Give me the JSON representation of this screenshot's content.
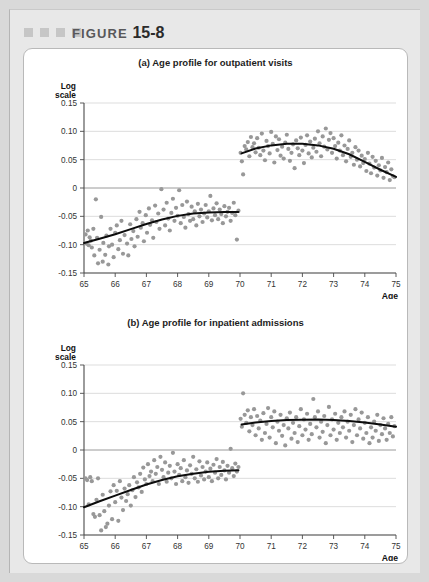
{
  "figure": {
    "label": "FIGURE",
    "number": "15-8",
    "marker_squares": 4,
    "square_color": "#c6c6c6",
    "panel_bg": "#e8e8e8",
    "card_bg": "#ffffff"
  },
  "style": {
    "dot_color": "#989898",
    "curve_color": "#0d0d0d",
    "grid_color": "#cfcfcf",
    "zero_line_color": "#8e8e8e",
    "axis_color": "#4a4a4a",
    "dot_radius": 2.1
  },
  "chart_data": [
    {
      "type": "scatter",
      "id": "panel-a",
      "title": "(a) Age profile for outpatient visits",
      "xlabel": "Age",
      "ylabel": "Log scale",
      "xlim": [
        65,
        75
      ],
      "ylim": [
        -0.15,
        0.15
      ],
      "xticks": [
        65,
        66,
        67,
        68,
        69,
        70,
        71,
        72,
        73,
        74,
        75
      ],
      "yticks": [
        0.15,
        0.1,
        0.05,
        0,
        -0.05,
        -0.1,
        -0.15
      ],
      "ytick_labels": [
        "0.15",
        "0.10",
        "0.05",
        "0",
        "-0.05",
        "-0.10",
        "-0.15"
      ],
      "grid": true,
      "discontinuity_at": 70,
      "legend": "none",
      "series": [
        {
          "name": "left-scatter",
          "x": [
            65.05,
            65.08,
            65.12,
            65.15,
            65.18,
            65.22,
            65.25,
            65.3,
            65.33,
            65.38,
            65.42,
            65.45,
            65.5,
            65.55,
            65.6,
            65.62,
            65.68,
            65.72,
            65.78,
            65.8,
            65.85,
            65.9,
            65.95,
            66.0,
            66.05,
            66.1,
            66.15,
            66.2,
            66.25,
            66.3,
            66.38,
            66.42,
            66.48,
            66.52,
            66.58,
            66.62,
            66.68,
            66.72,
            66.78,
            66.82,
            66.88,
            66.92,
            66.98,
            67.02,
            67.08,
            67.12,
            67.18,
            67.22,
            67.28,
            67.32,
            67.38,
            67.42,
            67.48,
            67.55,
            67.6,
            67.65,
            67.7,
            67.75,
            67.8,
            67.85,
            67.9,
            67.95,
            68.0,
            68.05,
            68.1,
            68.15,
            68.2,
            68.25,
            68.3,
            68.35,
            68.4,
            68.45,
            68.5,
            68.55,
            68.6,
            68.65,
            68.7,
            68.75,
            68.8,
            68.85,
            68.9,
            68.95,
            69.0,
            69.05,
            69.1,
            69.15,
            69.2,
            69.25,
            69.3,
            69.35,
            69.4,
            69.45,
            69.5,
            69.55,
            69.6,
            69.65,
            69.7,
            69.75,
            69.8,
            69.85,
            69.9,
            69.95
          ],
          "y": [
            -0.082,
            -0.098,
            -0.075,
            -0.101,
            -0.087,
            -0.093,
            -0.105,
            -0.072,
            -0.119,
            -0.02,
            -0.088,
            -0.133,
            -0.109,
            -0.051,
            -0.13,
            -0.097,
            -0.118,
            -0.084,
            -0.135,
            -0.103,
            -0.072,
            -0.1,
            -0.122,
            -0.079,
            -0.066,
            -0.108,
            -0.092,
            -0.058,
            -0.116,
            -0.083,
            -0.098,
            -0.119,
            -0.064,
            -0.09,
            -0.076,
            -0.103,
            -0.055,
            -0.086,
            -0.042,
            -0.07,
            -0.062,
            -0.094,
            -0.048,
            -0.079,
            -0.036,
            -0.065,
            -0.057,
            -0.088,
            -0.031,
            -0.06,
            -0.045,
            -0.072,
            -0.002,
            -0.038,
            -0.066,
            -0.026,
            -0.054,
            -0.075,
            -0.044,
            -0.019,
            -0.058,
            -0.035,
            -0.049,
            -0.004,
            -0.062,
            -0.03,
            -0.051,
            -0.07,
            -0.024,
            -0.046,
            -0.058,
            -0.033,
            -0.055,
            -0.041,
            -0.066,
            -0.028,
            -0.05,
            -0.038,
            -0.06,
            -0.045,
            -0.03,
            -0.052,
            -0.041,
            -0.014,
            -0.057,
            -0.036,
            -0.048,
            -0.027,
            -0.055,
            -0.038,
            -0.046,
            -0.062,
            -0.032,
            -0.05,
            -0.042,
            -0.035,
            -0.058,
            -0.044,
            -0.026,
            -0.048,
            -0.091,
            -0.04
          ]
        },
        {
          "name": "right-scatter",
          "x": [
            70.02,
            70.06,
            70.1,
            70.15,
            70.2,
            70.25,
            70.3,
            70.35,
            70.4,
            70.45,
            70.5,
            70.55,
            70.6,
            70.65,
            70.7,
            70.75,
            70.8,
            70.85,
            70.9,
            70.95,
            71.0,
            71.05,
            71.1,
            71.15,
            71.2,
            71.25,
            71.3,
            71.35,
            71.4,
            71.45,
            71.5,
            71.55,
            71.6,
            71.65,
            71.7,
            71.75,
            71.8,
            71.85,
            71.9,
            71.95,
            72.0,
            72.05,
            72.1,
            72.15,
            72.2,
            72.25,
            72.3,
            72.35,
            72.4,
            72.45,
            72.5,
            72.55,
            72.6,
            72.65,
            72.7,
            72.75,
            72.8,
            72.85,
            72.9,
            72.95,
            73.0,
            73.05,
            73.1,
            73.15,
            73.2,
            73.25,
            73.3,
            73.35,
            73.4,
            73.45,
            73.5,
            73.55,
            73.6,
            73.65,
            73.7,
            73.75,
            73.8,
            73.85,
            73.9,
            73.95,
            74.0,
            74.05,
            74.1,
            74.15,
            74.2,
            74.25,
            74.3,
            74.35,
            74.4,
            74.45,
            74.5,
            74.55,
            74.6,
            74.65,
            74.7,
            74.75,
            74.8,
            74.85,
            74.9,
            74.95
          ],
          "y": [
            0.062,
            0.047,
            0.024,
            0.074,
            0.068,
            0.081,
            0.056,
            0.09,
            0.072,
            0.079,
            0.063,
            0.088,
            0.071,
            0.058,
            0.096,
            0.066,
            0.049,
            0.083,
            0.074,
            0.061,
            0.099,
            0.078,
            0.045,
            0.091,
            0.067,
            0.086,
            0.057,
            0.073,
            0.052,
            0.08,
            0.094,
            0.069,
            0.048,
            0.062,
            0.077,
            0.035,
            0.084,
            0.07,
            0.058,
            0.089,
            0.066,
            0.044,
            0.076,
            0.093,
            0.061,
            0.082,
            0.054,
            0.071,
            0.087,
            0.064,
            0.1,
            0.079,
            0.056,
            0.091,
            0.073,
            0.105,
            0.068,
            0.085,
            0.097,
            0.062,
            0.088,
            0.074,
            0.052,
            0.08,
            0.066,
            0.093,
            0.058,
            0.075,
            0.047,
            0.069,
            0.084,
            0.055,
            0.062,
            0.041,
            0.072,
            0.05,
            0.066,
            0.038,
            0.057,
            0.044,
            0.051,
            0.03,
            0.062,
            0.043,
            0.026,
            0.055,
            0.036,
            0.048,
            0.022,
            0.04,
            0.031,
            0.053,
            0.018,
            0.037,
            0.028,
            0.045,
            0.014,
            0.033,
            0.021,
            0.019
          ]
        }
      ],
      "fit_curves": [
        {
          "name": "left-fit",
          "x": [
            65.0,
            65.5,
            66.0,
            66.5,
            67.0,
            67.5,
            68.0,
            68.5,
            69.0,
            69.5,
            69.95
          ],
          "y": [
            -0.097,
            -0.0895,
            -0.0815,
            -0.0725,
            -0.0635,
            -0.0555,
            -0.0492,
            -0.0452,
            -0.0432,
            -0.0425,
            -0.0424
          ]
        },
        {
          "name": "right-fit",
          "x": [
            70.05,
            70.5,
            71.0,
            71.5,
            72.0,
            72.5,
            73.0,
            73.5,
            74.0,
            74.5,
            75.0
          ],
          "y": [
            0.0612,
            0.0698,
            0.0752,
            0.0779,
            0.0779,
            0.0752,
            0.0692,
            0.0595,
            0.0462,
            0.0322,
            0.0195
          ]
        }
      ]
    },
    {
      "type": "scatter",
      "id": "panel-b",
      "title": "(b) Age profile for inpatient admissions",
      "xlabel": "Age",
      "ylabel": "Log scale",
      "xlim": [
        65,
        75
      ],
      "ylim": [
        -0.15,
        0.15
      ],
      "xticks": [
        65,
        66,
        67,
        68,
        69,
        70,
        71,
        72,
        73,
        74,
        75
      ],
      "yticks": [
        0.15,
        0.1,
        0.05,
        0,
        -0.05,
        -0.1,
        -0.15
      ],
      "ytick_labels": [
        "0.15",
        "0.10",
        "0.05",
        "0",
        "-0.05",
        "-0.10",
        "-0.15"
      ],
      "grid": true,
      "discontinuity_at": 70,
      "legend": "none",
      "series": [
        {
          "name": "left-scatter",
          "x": [
            65.05,
            65.1,
            65.15,
            65.2,
            65.25,
            65.3,
            65.35,
            65.4,
            65.45,
            65.5,
            65.55,
            65.6,
            65.65,
            65.7,
            65.75,
            65.8,
            65.85,
            65.9,
            65.95,
            66.0,
            66.05,
            66.1,
            66.15,
            66.2,
            66.25,
            66.3,
            66.35,
            66.4,
            66.45,
            66.5,
            66.55,
            66.6,
            66.65,
            66.7,
            66.75,
            66.8,
            66.85,
            66.9,
            66.95,
            67.0,
            67.05,
            67.1,
            67.15,
            67.2,
            67.25,
            67.3,
            67.35,
            67.4,
            67.45,
            67.5,
            67.55,
            67.6,
            67.65,
            67.7,
            67.75,
            67.8,
            67.85,
            67.9,
            67.95,
            68.0,
            68.05,
            68.1,
            68.15,
            68.2,
            68.25,
            68.3,
            68.35,
            68.4,
            68.45,
            68.5,
            68.55,
            68.6,
            68.65,
            68.7,
            68.75,
            68.8,
            68.85,
            68.9,
            68.95,
            69.0,
            69.05,
            69.1,
            69.15,
            69.2,
            69.25,
            69.3,
            69.35,
            69.4,
            69.45,
            69.5,
            69.55,
            69.6,
            69.65,
            69.7,
            69.75,
            69.8,
            69.85,
            69.9,
            69.95
          ],
          "y": [
            -0.05,
            -0.053,
            -0.096,
            -0.048,
            -0.055,
            -0.113,
            -0.118,
            -0.088,
            -0.05,
            -0.115,
            -0.142,
            -0.079,
            -0.108,
            -0.136,
            -0.13,
            -0.098,
            -0.073,
            -0.122,
            -0.062,
            -0.092,
            -0.072,
            -0.125,
            -0.055,
            -0.084,
            -0.106,
            -0.068,
            -0.09,
            -0.078,
            -0.062,
            -0.098,
            -0.071,
            -0.048,
            -0.083,
            -0.057,
            -0.066,
            -0.042,
            -0.074,
            -0.031,
            -0.052,
            -0.06,
            -0.025,
            -0.046,
            -0.038,
            -0.055,
            -0.018,
            -0.042,
            -0.03,
            -0.06,
            -0.012,
            -0.035,
            -0.048,
            -0.022,
            -0.056,
            -0.04,
            -0.028,
            -0.05,
            -0.005,
            -0.038,
            -0.06,
            -0.025,
            -0.044,
            -0.032,
            -0.055,
            -0.018,
            -0.048,
            -0.036,
            -0.058,
            -0.027,
            -0.042,
            -0.012,
            -0.05,
            -0.034,
            -0.056,
            -0.02,
            -0.045,
            -0.03,
            -0.052,
            -0.038,
            -0.022,
            -0.048,
            -0.033,
            -0.055,
            -0.026,
            -0.04,
            -0.016,
            -0.05,
            -0.03,
            -0.044,
            -0.021,
            -0.036,
            -0.052,
            -0.028,
            -0.04,
            0.002,
            -0.032,
            -0.046,
            -0.024,
            -0.038,
            -0.03
          ]
        },
        {
          "name": "right-scatter",
          "x": [
            70.02,
            70.06,
            70.1,
            70.15,
            70.2,
            70.25,
            70.3,
            70.35,
            70.4,
            70.45,
            70.5,
            70.55,
            70.6,
            70.65,
            70.7,
            70.75,
            70.8,
            70.85,
            70.9,
            70.95,
            71.0,
            71.05,
            71.1,
            71.15,
            71.2,
            71.25,
            71.3,
            71.35,
            71.4,
            71.45,
            71.5,
            71.55,
            71.6,
            71.65,
            71.7,
            71.75,
            71.8,
            71.85,
            71.9,
            71.95,
            72.0,
            72.05,
            72.1,
            72.15,
            72.2,
            72.25,
            72.3,
            72.35,
            72.4,
            72.45,
            72.5,
            72.55,
            72.6,
            72.65,
            72.7,
            72.75,
            72.8,
            72.85,
            72.9,
            72.95,
            73.0,
            73.05,
            73.1,
            73.15,
            73.2,
            73.25,
            73.3,
            73.35,
            73.4,
            73.45,
            73.5,
            73.55,
            73.6,
            73.65,
            73.7,
            73.75,
            73.8,
            73.85,
            73.9,
            73.95,
            74.0,
            74.05,
            74.1,
            74.15,
            74.2,
            74.25,
            74.3,
            74.35,
            74.4,
            74.45,
            74.5,
            74.55,
            74.6,
            74.65,
            74.7,
            74.75,
            74.8,
            74.85,
            74.9,
            74.95
          ],
          "y": [
            0.055,
            0.041,
            0.1,
            0.062,
            0.048,
            0.07,
            0.033,
            0.058,
            0.044,
            0.072,
            0.026,
            0.06,
            0.038,
            0.052,
            0.018,
            0.065,
            0.03,
            0.046,
            0.074,
            0.022,
            0.058,
            0.04,
            0.068,
            0.012,
            0.05,
            0.034,
            0.062,
            0.025,
            0.044,
            0.008,
            0.056,
            0.038,
            0.066,
            0.02,
            0.048,
            0.03,
            0.058,
            0.014,
            0.042,
            0.072,
            0.026,
            0.054,
            0.036,
            0.064,
            0.018,
            0.046,
            0.028,
            0.09,
            0.058,
            0.04,
            0.068,
            0.022,
            0.05,
            0.032,
            0.06,
            0.012,
            0.044,
            0.076,
            0.026,
            0.054,
            0.036,
            0.064,
            0.018,
            0.048,
            0.03,
            0.058,
            0.04,
            0.068,
            0.022,
            0.05,
            0.034,
            0.062,
            0.014,
            0.044,
            0.072,
            0.026,
            0.054,
            0.038,
            0.066,
            0.02,
            0.048,
            0.03,
            0.058,
            0.012,
            0.04,
            0.022,
            0.05,
            0.034,
            0.062,
            0.016,
            0.044,
            0.028,
            0.056,
            0.038,
            0.018,
            0.046,
            0.03,
            0.058,
            0.024,
            0.042
          ]
        }
      ],
      "fit_curves": [
        {
          "name": "left-fit",
          "x": [
            65.0,
            65.5,
            66.0,
            66.5,
            67.0,
            67.5,
            68.0,
            68.5,
            69.0,
            69.5,
            69.95
          ],
          "y": [
            -0.101,
            -0.0905,
            -0.0805,
            -0.0705,
            -0.0608,
            -0.0528,
            -0.0465,
            -0.0418,
            -0.0386,
            -0.0366,
            -0.0356
          ]
        },
        {
          "name": "right-fit",
          "x": [
            70.05,
            70.5,
            71.0,
            71.5,
            72.0,
            72.5,
            73.0,
            73.5,
            74.0,
            74.5,
            75.0
          ],
          "y": [
            0.0452,
            0.0485,
            0.0512,
            0.0528,
            0.0536,
            0.0537,
            0.0529,
            0.0512,
            0.0486,
            0.0452,
            0.0412
          ]
        }
      ]
    }
  ]
}
